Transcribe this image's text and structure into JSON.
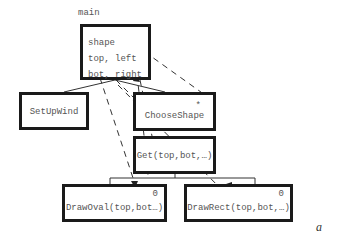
{
  "diagram": {
    "type": "structure-chart",
    "main": {
      "label": "main",
      "variables": [
        "shape",
        "top, left",
        "bot, right"
      ]
    },
    "modules": {
      "setupwind": {
        "label": "SetUpWind"
      },
      "chooseshape": {
        "label": "ChooseShape",
        "marker": "*"
      },
      "get": {
        "label": "Get(top,bot,…)"
      },
      "drawoval": {
        "label": "DrawOval(top,bot…)",
        "marker": "0"
      },
      "drawrect": {
        "label": "DrawRect(top,bot,…)",
        "marker": "0"
      }
    },
    "figure_tag": "a",
    "colors": {
      "box_border": "#1a1a1a",
      "text": "#555555",
      "lines": "#333333"
    }
  }
}
